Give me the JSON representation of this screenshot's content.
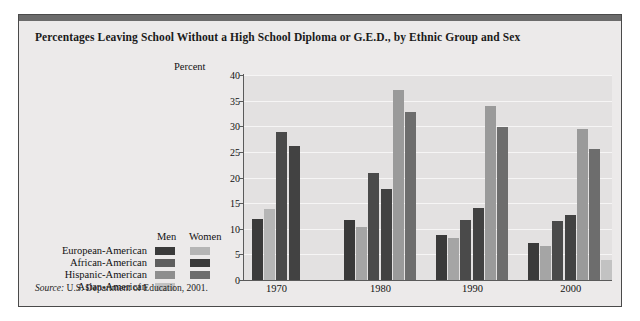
{
  "figure": {
    "title": "Percentages Leaving School Without a High School Diploma or G.E.D., by Ethnic Group and Sex",
    "source_prefix": "Source:",
    "source_text": " U.S. Department of Education, 2001."
  },
  "legend": {
    "men_header": "Men",
    "women_header": "Women",
    "rows": [
      {
        "label": "European-American",
        "men_color": "#3a3a3a",
        "women_color": "#b5b5b5"
      },
      {
        "label": "African-American",
        "men_color": "#5e5e5e",
        "women_color": "#3a3a3a"
      },
      {
        "label": "Hispanic-American",
        "men_color": "#8e8e8e",
        "women_color": "#6d6d6d"
      },
      {
        "label": "Asian-American",
        "men_color": "#c2c2c2",
        "women_color": null
      }
    ]
  },
  "colors": {
    "card_background": "#eceaea",
    "plot_background": "#e3e1e1",
    "gridline": "#f6f5f5",
    "axis": "#5a5a5a",
    "topbar": "#6b6b6b",
    "text": "#111111"
  },
  "chart_data": {
    "type": "bar",
    "title": "Percentages Leaving School Without a High School Diploma or G.E.D., by Ethnic Group and Sex",
    "xlabel": "",
    "ylabel": "Percent",
    "ylim": [
      0,
      40
    ],
    "yticks": [
      0,
      5,
      10,
      15,
      20,
      25,
      30,
      35,
      40
    ],
    "grid": true,
    "legend_position": "left-outside",
    "categories": [
      "1970",
      "1980",
      "1990",
      "2000"
    ],
    "groups": [
      {
        "category": "1970",
        "bars": [
          {
            "series": "European-American Men",
            "value": 11.9,
            "color": "#3a3a3a"
          },
          {
            "series": "European-American Women",
            "value": 13.9,
            "color": "#b5b5b5"
          },
          {
            "series": "African-American Men",
            "value": 28.8,
            "color": "#4a4a4a"
          },
          {
            "series": "African-American Women",
            "value": 26.2,
            "color": "#424242"
          }
        ]
      },
      {
        "category": "1980",
        "bars": [
          {
            "series": "European-American Men",
            "value": 11.8,
            "color": "#3a3a3a"
          },
          {
            "series": "European-American Women",
            "value": 10.3,
            "color": "#a5a5a5"
          },
          {
            "series": "African-American Men",
            "value": 20.8,
            "color": "#4a4a4a"
          },
          {
            "series": "African-American Women",
            "value": 17.7,
            "color": "#424242"
          },
          {
            "series": "Hispanic-American Men",
            "value": 37.0,
            "color": "#9a9a9a"
          },
          {
            "series": "Hispanic-American Women",
            "value": 32.8,
            "color": "#6d6d6d"
          }
        ]
      },
      {
        "category": "1990",
        "bars": [
          {
            "series": "European-American Men",
            "value": 8.8,
            "color": "#3a3a3a"
          },
          {
            "series": "European-American Women",
            "value": 8.2,
            "color": "#a5a5a5"
          },
          {
            "series": "African-American Men",
            "value": 11.8,
            "color": "#4a4a4a"
          },
          {
            "series": "African-American Women",
            "value": 14.1,
            "color": "#424242"
          },
          {
            "series": "Hispanic-American Men",
            "value": 33.9,
            "color": "#9a9a9a"
          },
          {
            "series": "Hispanic-American Women",
            "value": 29.8,
            "color": "#6d6d6d"
          }
        ]
      },
      {
        "category": "2000",
        "bars": [
          {
            "series": "European-American Men",
            "value": 7.2,
            "color": "#3a3a3a"
          },
          {
            "series": "European-American Women",
            "value": 6.7,
            "color": "#a5a5a5"
          },
          {
            "series": "African-American Men",
            "value": 11.6,
            "color": "#4a4a4a"
          },
          {
            "series": "African-American Women",
            "value": 12.6,
            "color": "#424242"
          },
          {
            "series": "Hispanic-American Men",
            "value": 29.5,
            "color": "#9a9a9a"
          },
          {
            "series": "Hispanic-American Women",
            "value": 25.5,
            "color": "#6d6d6d"
          },
          {
            "series": "Asian-American Men",
            "value": 3.9,
            "color": "#c2c2c2"
          }
        ]
      }
    ]
  }
}
